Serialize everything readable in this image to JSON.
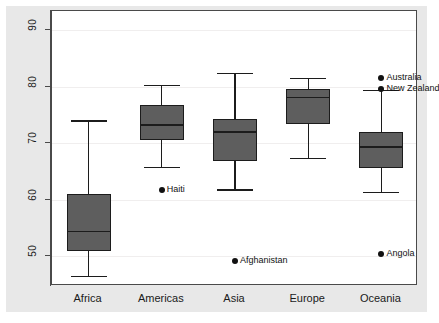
{
  "chart_data": {
    "type": "box",
    "title": "",
    "xlabel": "",
    "ylabel": "Life expectancy at birth 2005/2010",
    "ylim": [
      44,
      92
    ],
    "yticks": [
      50,
      60,
      70,
      80,
      90
    ],
    "ytick_labels": [
      "50",
      "60",
      "70",
      "80",
      "90"
    ],
    "grid": true,
    "legend": "none",
    "categories": [
      "Africa",
      "Americas",
      "Asia",
      "Europe",
      "Oceania"
    ],
    "boxes": [
      {
        "category": "Africa",
        "whisker_low": 46.5,
        "q1": 50.8,
        "median": 54.5,
        "q3": 61.0,
        "whisker_high": 74.0
      },
      {
        "category": "Americas",
        "whisker_low": 65.8,
        "q1": 70.6,
        "median": 73.3,
        "q3": 76.8,
        "whisker_high": 80.3
      },
      {
        "category": "Asia",
        "whisker_low": 61.8,
        "q1": 66.8,
        "median": 72.1,
        "q3": 74.2,
        "whisker_high": 82.4
      },
      {
        "category": "Europe",
        "whisker_low": 67.4,
        "q1": 73.4,
        "median": 78.2,
        "q3": 79.6,
        "whisker_high": 81.5
      },
      {
        "category": "Oceania",
        "whisker_low": 61.4,
        "q1": 65.5,
        "median": 69.4,
        "q3": 72.0,
        "whisker_high": 79.4
      }
    ],
    "outliers": [
      {
        "label": "Haiti",
        "category": "Americas",
        "value": 61.7
      },
      {
        "label": "Afghanistan",
        "category": "Asia",
        "value": 49.1
      },
      {
        "label": "Australia",
        "category": "Oceania",
        "value": 81.5
      },
      {
        "label": "New Zealand",
        "category": "Oceania",
        "value": 79.6
      },
      {
        "label": "Angola",
        "category": "Oceania",
        "value": 50.4
      }
    ],
    "colors": {
      "box_fill": "#5e5e5e",
      "box_edge": "#1c1c1c",
      "panel_bg": "#ffffff",
      "figure_bg": "#e8e8e8",
      "gridline": "#f0eeee",
      "text": "#1a1a1a"
    }
  }
}
